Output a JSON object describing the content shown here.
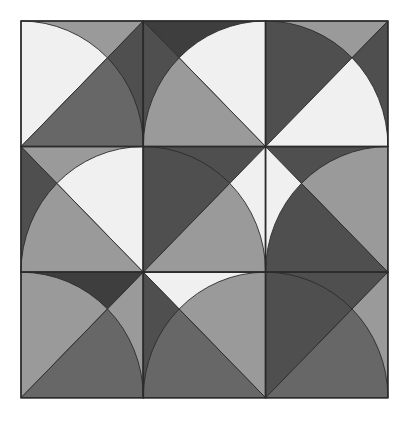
{
  "artwork": {
    "title": "Quarter-Disc Tiling Pattern",
    "type": "geometric-tile-grid",
    "canvas_width": 408,
    "canvas_height": 421,
    "background_color": "#ffffff",
    "grid": {
      "rows": 3,
      "columns": 9,
      "tile_count": 9,
      "origin_x": 21,
      "origin_y": 21,
      "tile_width": 122.3,
      "tile_height": 125.6,
      "border_color": "#2b2b2b",
      "border_width": 1.6
    },
    "palette": {
      "white": "#ffffff",
      "near_white": "#f0f0f0",
      "light_gray": "#c9c9c9",
      "mid_gray": "#9a9a9a",
      "medium_dark_gray": "#676767",
      "dark_gray": "#4f4f4f",
      "darkest_gray": "#3e3e3e",
      "outline": "#2b2b2b"
    },
    "motif_description": "Each tile carries two quarter-discs of radius equal to the tile side, anchored at opposite corners; each quarter-disc is bisected by a corner-to-corner diagonal into two wedges of differing gray value.",
    "tiles": [
      {
        "index": 1,
        "row": 0,
        "col": 0,
        "name": "tile-r0-c0",
        "discs": [
          {
            "anchor": "top-right",
            "wedge_a": "#9a9a9a",
            "wedge_b": "#4f4f4f"
          },
          {
            "anchor": "bottom-left",
            "wedge_a": "#f0f0f0",
            "wedge_b": "#676767"
          }
        ]
      },
      {
        "index": 2,
        "row": 0,
        "col": 1,
        "name": "tile-r0-c1",
        "discs": [
          {
            "anchor": "top-left",
            "wedge_a": "#3e3e3e",
            "wedge_b": "#4f4f4f"
          },
          {
            "anchor": "bottom-right",
            "wedge_a": "#f0f0f0",
            "wedge_b": "#9a9a9a"
          }
        ]
      },
      {
        "index": 3,
        "row": 0,
        "col": 2,
        "name": "tile-r0-c2",
        "discs": [
          {
            "anchor": "top-right",
            "wedge_a": "#9a9a9a",
            "wedge_b": "#4f4f4f"
          },
          {
            "anchor": "bottom-left",
            "wedge_a": "#4f4f4f",
            "wedge_b": "#f0f0f0"
          }
        ]
      },
      {
        "index": 4,
        "row": 1,
        "col": 0,
        "name": "tile-r1-c0",
        "discs": [
          {
            "anchor": "top-left",
            "wedge_a": "#9a9a9a",
            "wedge_b": "#4f4f4f"
          },
          {
            "anchor": "bottom-right",
            "wedge_a": "#f0f0f0",
            "wedge_b": "#9a9a9a"
          }
        ]
      },
      {
        "index": 5,
        "row": 1,
        "col": 1,
        "name": "tile-r1-c1",
        "discs": [
          {
            "anchor": "top-right",
            "wedge_a": "#4f4f4f",
            "wedge_b": "#f0f0f0"
          },
          {
            "anchor": "bottom-left",
            "wedge_a": "#4f4f4f",
            "wedge_b": "#9a9a9a"
          }
        ]
      },
      {
        "index": 6,
        "row": 1,
        "col": 2,
        "name": "tile-r1-c2",
        "discs": [
          {
            "anchor": "top-left",
            "wedge_a": "#4f4f4f",
            "wedge_b": "#f0f0f0"
          },
          {
            "anchor": "bottom-right",
            "wedge_a": "#9a9a9a",
            "wedge_b": "#4f4f4f"
          }
        ]
      },
      {
        "index": 7,
        "row": 2,
        "col": 0,
        "name": "tile-r2-c0",
        "discs": [
          {
            "anchor": "top-right",
            "wedge_a": "#3e3e3e",
            "wedge_b": "#9a9a9a"
          },
          {
            "anchor": "bottom-left",
            "wedge_a": "#9a9a9a",
            "wedge_b": "#676767"
          }
        ]
      },
      {
        "index": 8,
        "row": 2,
        "col": 1,
        "name": "tile-r2-c1",
        "discs": [
          {
            "anchor": "top-left",
            "wedge_a": "#f0f0f0",
            "wedge_b": "#4f4f4f"
          },
          {
            "anchor": "bottom-right",
            "wedge_a": "#9a9a9a",
            "wedge_b": "#676767"
          }
        ]
      },
      {
        "index": 9,
        "row": 2,
        "col": 2,
        "name": "tile-r2-c2",
        "discs": [
          {
            "anchor": "top-right",
            "wedge_a": "#4f4f4f",
            "wedge_b": "#9a9a9a"
          },
          {
            "anchor": "bottom-left",
            "wedge_a": "#4f4f4f",
            "wedge_b": "#676767"
          }
        ]
      }
    ]
  }
}
